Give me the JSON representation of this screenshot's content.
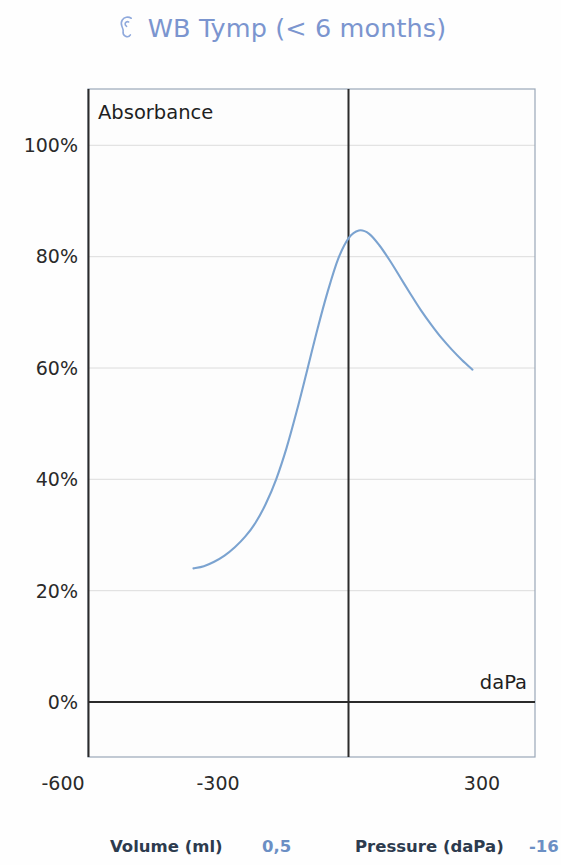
{
  "header": {
    "icon": "ear-icon",
    "title": "WB Tymp (< 6 months)",
    "title_color": "#7b95cf"
  },
  "readouts": {
    "volume_label": "Volume (ml)",
    "volume_value": "0,5",
    "pressure_label": "Pressure (daPa)",
    "pressure_value": "-16",
    "label_color": "#2d3b4e",
    "value_color": "#6b8fc4"
  },
  "chart_data": {
    "type": "line",
    "title": "WB Tymp (< 6 months)",
    "xlabel": "daPa",
    "ylabel": "Absorbance",
    "ylabel_position": "inside-top-left",
    "xlabel_position": "inside-bottom-right",
    "xlim": [
      -700,
      400
    ],
    "ylim": [
      -8,
      108
    ],
    "x_ticks": [
      -600,
      -300,
      300
    ],
    "x_tick_labels": [
      "-600",
      "-300",
      "300"
    ],
    "y_ticks": [
      0,
      20,
      40,
      60,
      80,
      100
    ],
    "y_tick_labels": [
      "0%",
      "20%",
      "40%",
      "60%",
      "80%",
      "100%"
    ],
    "grid": "horizontal-only",
    "grid_color": "#dcdcdc",
    "axis_color": "#2b2b2b",
    "zero_vline": 0,
    "zero_hline": 0,
    "line_color": "#7ba3d0",
    "line_width": 2.1,
    "series": [
      {
        "name": "Absorbance",
        "x": [
          -300,
          -280,
          -260,
          -240,
          -220,
          -200,
          -180,
          -160,
          -140,
          -120,
          -100,
          -80,
          -60,
          -40,
          -20,
          0,
          20,
          40,
          60,
          80,
          100,
          120,
          140,
          160,
          180,
          200,
          220,
          240
        ],
        "values": [
          24.0,
          24.4,
          25.2,
          26.3,
          27.8,
          29.7,
          32.2,
          35.6,
          40.0,
          45.6,
          52.3,
          59.6,
          67.0,
          73.8,
          79.6,
          83.3,
          84.7,
          84.1,
          82.0,
          79.3,
          76.3,
          73.3,
          70.4,
          67.8,
          65.4,
          63.3,
          61.4,
          59.7
        ]
      }
    ]
  }
}
